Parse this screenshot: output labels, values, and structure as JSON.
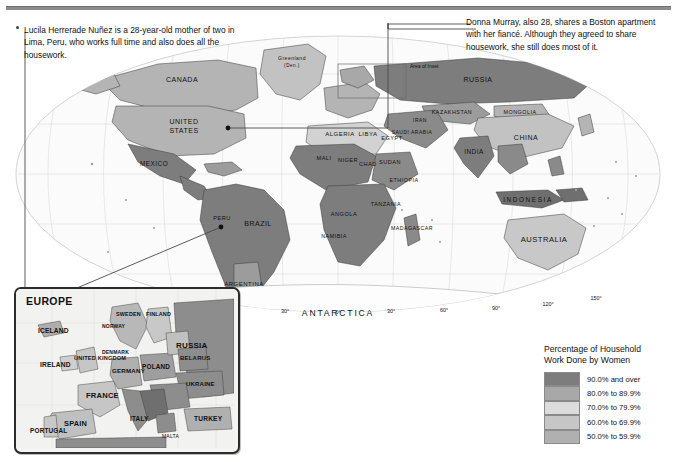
{
  "page": {
    "background": "#ffffff",
    "rule_color": "#8b8b8b"
  },
  "callouts": [
    {
      "id": "callout-lucila",
      "text": "Lucila Herrerade Nuñez is a 28-year-old mother of two in Lima, Peru, who works full time and also does all the housework.",
      "anchor_label": "Peru"
    },
    {
      "id": "callout-donna",
      "text": "Donna Murray, also 28, shares a Boston apartment with her fiancé. Although they agreed to share housework, she still does most of it.",
      "anchor_label": "Boston, United States"
    }
  ],
  "legend": {
    "title_line1": "Percentage of Household",
    "title_line2": "Work Done by Women",
    "classes": [
      {
        "label": "90.0% and over",
        "color": "#7d7d7d"
      },
      {
        "label": "80.0% to 89.9%",
        "color": "#a8a8a8"
      },
      {
        "label": "70.0% to 79.9%",
        "color": "#dcdcdc"
      },
      {
        "label": "60.0% to 69.9%",
        "color": "#c6c6c6"
      },
      {
        "label": "50.0% to 59.9%",
        "color": "#b0b0b0"
      }
    ]
  },
  "inset": {
    "title": "EUROPE",
    "labels": [
      "ICELAND",
      "IRELAND",
      "UNITED KINGDOM",
      "NORWAY",
      "SWEDEN",
      "FINLAND",
      "DENMARK",
      "ESTONIA",
      "LATVIA",
      "LITHUANIA",
      "BELARUS",
      "POLAND",
      "GERMANY",
      "NETH.",
      "BEL.",
      "LUX.",
      "FRANCE",
      "SPAIN",
      "PORTUGAL",
      "SWITZ.",
      "AUSTRIA",
      "CZECH",
      "SLOVAKIA",
      "HUNGARY",
      "SLOVENIA",
      "CROATIA",
      "BOS. & HER.",
      "SERBIA",
      "MONT.",
      "ALB.",
      "MACEDONIA",
      "GREECE",
      "ITALY",
      "ROMANIA",
      "BULGARIA",
      "MOLDOVA",
      "UKRAINE",
      "RUSSIA",
      "TURKEY",
      "MALTA",
      "CYPRUS",
      "KOS."
    ],
    "lat_ticks": [
      "60°",
      "50°",
      "40°"
    ],
    "lon_ticks": [
      "20°",
      "10°",
      "0°",
      "10°",
      "20°",
      "30°"
    ]
  },
  "map": {
    "inset_marker": "Area of Inset",
    "antarctica_label": "ANTARCTICA",
    "lon_ticks": [
      "150°",
      "120°",
      "90°",
      "60°",
      "30°",
      "0°",
      "30°",
      "60°",
      "90°",
      "120°",
      "150°"
    ],
    "major_labels": [
      "CANADA",
      "UNITED STATES",
      "MEXICO",
      "BRAZIL",
      "ARGENTINA",
      "CHILE",
      "PERU",
      "BOLIVIA",
      "COLOMBIA",
      "VENEZUELA",
      "ECUADOR",
      "SURINAME",
      "URUGUAY",
      "PARAGUAY",
      "GUYANA",
      "RUSSIA",
      "CHINA",
      "INDIA",
      "KAZAKHSTAN",
      "MONGOLIA",
      "AUSTRALIA",
      "INDONESIA",
      "ALGERIA",
      "LIBYA",
      "EGYPT",
      "MALI",
      "NIGER",
      "CHAD",
      "SUDAN",
      "ETHIOPIA",
      "SOMALIA",
      "NIGERIA",
      "ANGOLA",
      "NAMIBIA",
      "BOTSWANA",
      "TANZANIA",
      "MADAGASCAR",
      "MOZAMBIQUE",
      "ZAMBIA",
      "SAUDI ARABIA",
      "IRAN",
      "IRAQ",
      "TURKEY",
      "PAKISTAN",
      "AFGHANISTAN",
      "THAILAND",
      "VIETNAM",
      "MYANMAR",
      "PHILIPPINES",
      "JAPAN",
      "MAURITANIA",
      "SOUTH AFRICA",
      "DEM. REP. OF THE CONGO",
      "GREENLAND (Den.)",
      "NEW ZEALAND",
      "PAPUA NEW GUINEA",
      "UZBEKISTAN",
      "TURKMENISTAN",
      "KYRGYZSTAN",
      "TAJIKISTAN",
      "NORTH KOREA",
      "SOUTH KOREA",
      "MALAYSIA",
      "CAMBODIA",
      "LAOS",
      "BANGLADESH",
      "NEPAL",
      "BHUTAN",
      "SRI LANKA",
      "MALDIVES",
      "YEMEN",
      "OMAN",
      "SYRIA",
      "JORDAN",
      "ISRAEL",
      "KUWAIT",
      "GEORGIA",
      "ARMENIA",
      "AZERBAIJAN",
      "MOROCCO",
      "TUNISIA",
      "SENEGAL",
      "GUINEA",
      "SIERRA LEONE",
      "LIBERIA",
      "CÔTE D'IVOIRE",
      "GHANA",
      "TOGO",
      "BENIN",
      "CAMEROON",
      "GABON",
      "KENYA",
      "UGANDA",
      "RWANDA",
      "BURUNDI",
      "MALAWI",
      "ZIMBABWE",
      "LESOTHO",
      "SWAZILAND",
      "GUATEMALA",
      "EL SALVADOR",
      "HONDURAS",
      "NICARAGUA",
      "COSTA RICA",
      "PANAMA",
      "BELIZE",
      "CUBA",
      "HAITI",
      "DOM. REP.",
      "JAMAICA",
      "BAHAMAS",
      "PUERTO RICO (U.S.)",
      "FIJI",
      "VANUATU",
      "SOLOMON ISLANDS",
      "PALAU",
      "NAURU",
      "TUVALU",
      "KIRIBATI",
      "MARSHALL ISLANDS",
      "FEDERATED STATES OF MICRONESIA",
      "TIMOR-LESTE",
      "NEW CALEDONIA (Fr.)",
      "FRENCH GUIANA (Fr.)",
      "Western Sahara",
      "ERITREA",
      "DJIBOUTI",
      "COMOROS",
      "SEYCHELLES",
      "MAURITIUS",
      "CENTRAL AFRICAN REPUBLIC",
      "REP. OF THE CONGO",
      "SAO TOME & PRINCIPE",
      "EQ. GUINEA",
      "GUINEA-BISSAU",
      "GAMBIA",
      "BURKINA FASO",
      "U.S.",
      "SAMOA",
      "TONGA"
    ]
  }
}
